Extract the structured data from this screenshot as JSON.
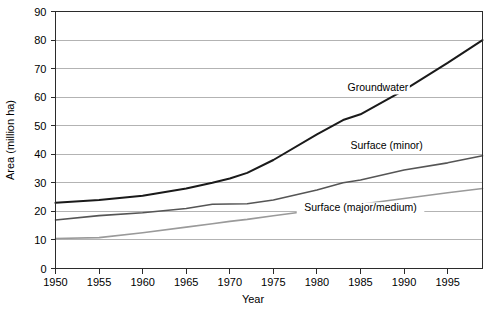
{
  "chart_data": {
    "type": "line",
    "title": "",
    "xlabel": "Year",
    "ylabel": "Area (million ha)",
    "xlim": [
      1950,
      1999
    ],
    "ylim": [
      0,
      90
    ],
    "grid": "horizontal",
    "legend_position": "inline-annotations",
    "x_ticks": [
      "1950",
      "1955",
      "1960",
      "1965",
      "1970",
      "1975",
      "1980",
      "1985",
      "1990",
      "1995"
    ],
    "x_tick_values": [
      1950,
      1955,
      1960,
      1965,
      1970,
      1975,
      1980,
      1985,
      1990,
      1995
    ],
    "y_ticks": [
      "0",
      "10",
      "20",
      "30",
      "40",
      "50",
      "60",
      "70",
      "80",
      "90"
    ],
    "y_tick_values": [
      0,
      10,
      20,
      30,
      40,
      50,
      60,
      70,
      80,
      90
    ],
    "x": [
      1950,
      1955,
      1960,
      1965,
      1968,
      1970,
      1972,
      1975,
      1980,
      1983,
      1985,
      1990,
      1995,
      1999
    ],
    "series": [
      {
        "name": "Groundwater",
        "color": "#1a1a1a",
        "width": 2.0,
        "label_x": 1987,
        "label_y": 62,
        "values": [
          23.0,
          24.0,
          25.5,
          28.0,
          30.0,
          31.5,
          33.5,
          38.0,
          47.0,
          52.0,
          54.0,
          62.5,
          72.0,
          80.0
        ]
      },
      {
        "name": "Surface (minor)",
        "color": "#555555",
        "width": 1.6,
        "label_x": 1988,
        "label_y": 42,
        "values": [
          17.0,
          18.5,
          19.5,
          21.0,
          22.5,
          22.6,
          22.7,
          24.0,
          27.5,
          30.0,
          31.0,
          34.5,
          37.0,
          39.5
        ]
      },
      {
        "name": "Surface (major/medium)",
        "color": "#9a9a9a",
        "width": 1.6,
        "label_x": 1985,
        "label_y": 20,
        "values": [
          10.5,
          10.8,
          12.5,
          14.5,
          15.7,
          16.5,
          17.2,
          18.5,
          20.5,
          21.8,
          22.5,
          24.5,
          26.5,
          28.0
        ]
      }
    ]
  }
}
